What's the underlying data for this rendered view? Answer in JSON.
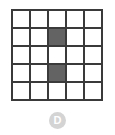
{
  "figure": {
    "label": "D",
    "grid": {
      "rows": 5,
      "cols": 5,
      "line_color": "#3a3a3a",
      "empty_color": "#ffffff",
      "filled_color": "#636363",
      "filled_cells": [
        {
          "row": 2,
          "col": 3
        },
        {
          "row": 4,
          "col": 3
        }
      ],
      "cells": [
        [
          0,
          0,
          0,
          0,
          0
        ],
        [
          0,
          0,
          1,
          0,
          0
        ],
        [
          0,
          0,
          0,
          0,
          0
        ],
        [
          0,
          0,
          1,
          0,
          0
        ],
        [
          0,
          0,
          0,
          0,
          0
        ]
      ]
    },
    "badge": {
      "text": "D",
      "background_color": "#d4d4d4",
      "text_color": "#ffffff"
    }
  }
}
